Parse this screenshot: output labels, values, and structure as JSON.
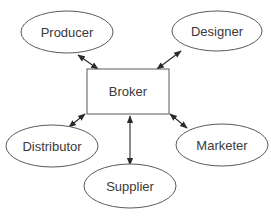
{
  "diagram": {
    "type": "hub-and-spoke",
    "hub": {
      "id": "broker",
      "label": "Broker",
      "shape": "rectangle"
    },
    "nodes": [
      {
        "id": "producer",
        "label": "Producer",
        "shape": "ellipse"
      },
      {
        "id": "designer",
        "label": "Designer",
        "shape": "ellipse"
      },
      {
        "id": "distributor",
        "label": "Distributor",
        "shape": "ellipse"
      },
      {
        "id": "marketer",
        "label": "Marketer",
        "shape": "ellipse"
      },
      {
        "id": "supplier",
        "label": "Supplier",
        "shape": "ellipse"
      }
    ],
    "edges": [
      {
        "from": "broker",
        "to": "producer",
        "direction": "bidirectional"
      },
      {
        "from": "broker",
        "to": "designer",
        "direction": "bidirectional"
      },
      {
        "from": "broker",
        "to": "distributor",
        "direction": "bidirectional"
      },
      {
        "from": "broker",
        "to": "marketer",
        "direction": "bidirectional"
      },
      {
        "from": "broker",
        "to": "supplier",
        "direction": "bidirectional"
      }
    ]
  },
  "colors": {
    "stroke": "#5a5a5a",
    "arrow": "#2b2b2b",
    "text": "#3a3a3a",
    "background": "#ffffff"
  }
}
